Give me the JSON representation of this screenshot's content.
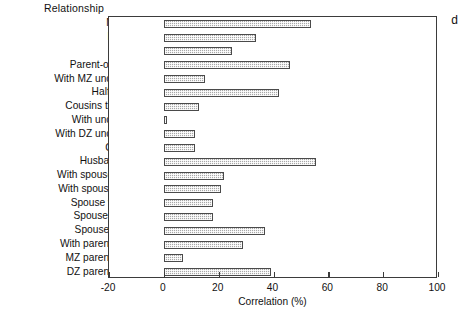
{
  "figure": {
    "panel_letter": "d",
    "labels_header": "Relationship"
  },
  "chart_data": {
    "type": "bar",
    "orientation": "horizontal",
    "title": "",
    "xlabel": "Correlation (%)",
    "ylabel": "Relationship",
    "xlim": [
      -20,
      100
    ],
    "xticks": [
      -20,
      0,
      20,
      40,
      60,
      80,
      100
    ],
    "xticklabels": [
      "-20",
      "0",
      "20",
      "40",
      "60",
      "80",
      "100"
    ],
    "grid": false,
    "legend": null,
    "bar_fill": "#a8a8a8",
    "bar_edge": "#4a4a4a",
    "categories": [
      "MZ twin",
      "DZ twin",
      "Sibling",
      "Parent-offspring",
      "With MZ uncle/aunt",
      "Half-sibling",
      "Cousins thro' MZ",
      "With uncle/aunt",
      "With DZ uncle/aunt",
      "Cousins",
      "Husband-wife",
      "With spouse of MZ",
      "With spouse of  DZ",
      "Spouse with sib",
      "Spouses of MZ",
      "Spouses of DZ",
      "With parent-in-law",
      "MZ parent-in-law",
      "DZ parent-in-law"
    ],
    "values": [
      53.5,
      33.5,
      25.0,
      46.0,
      15.0,
      42.0,
      13.0,
      1.0,
      11.5,
      11.5,
      55.5,
      22.0,
      21.0,
      18.0,
      18.0,
      37.0,
      29.0,
      7.0,
      39.0
    ]
  }
}
